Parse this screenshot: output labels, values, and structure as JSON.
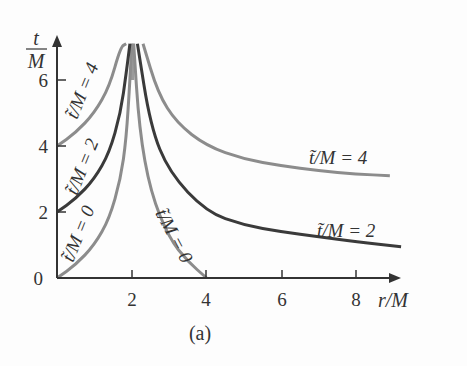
{
  "chart_data": {
    "type": "line",
    "title": "",
    "caption": "(a)",
    "xlabel": "r/M",
    "ylabel_num": "t",
    "ylabel_den": "M",
    "xlim": [
      0,
      9.5
    ],
    "ylim": [
      0,
      7.1
    ],
    "xticks": [
      "2",
      "4",
      "6",
      "8"
    ],
    "yticks": [
      "0",
      "2",
      "4",
      "6"
    ],
    "grid": false,
    "series": [
      {
        "name": "t̃/M = 0 (r<2M)",
        "color": "#8c8c8c",
        "x": [
          0,
          0.5,
          1.0,
          1.4,
          1.7,
          1.85,
          1.95,
          2.0
        ],
        "y": [
          0,
          0.4,
          1.0,
          1.8,
          3.0,
          4.2,
          6.0,
          7.1
        ]
      },
      {
        "name": "t̃/M = 2 (r<2M)",
        "color": "#3a3a3a",
        "x": [
          0,
          0.5,
          1.0,
          1.4,
          1.7,
          1.85,
          1.95
        ],
        "y": [
          2,
          2.4,
          3.0,
          3.8,
          5.0,
          6.2,
          7.1
        ]
      },
      {
        "name": "t̃/M = 4 (r<2M)",
        "color": "#8c8c8c",
        "x": [
          0,
          0.5,
          1.0,
          1.4,
          1.7,
          1.85
        ],
        "y": [
          4,
          4.4,
          5.0,
          5.8,
          7.0,
          7.1
        ]
      },
      {
        "name": "t̃/M = 0 (r>2M)",
        "color": "#8c8c8c",
        "x": [
          2.05,
          2.2,
          2.5,
          3.0,
          3.5,
          4.0
        ],
        "y": [
          7.1,
          4.5,
          2.6,
          1.2,
          0.5,
          0
        ]
      },
      {
        "name": "t̃/M = 2 (r>2M)",
        "color": "#3a3a3a",
        "x": [
          2.15,
          2.5,
          3.0,
          4.0,
          5.0,
          6.0,
          7.0,
          8.0,
          9.2
        ],
        "y": [
          7.1,
          4.6,
          3.2,
          2.0,
          1.6,
          1.4,
          1.25,
          1.1,
          0.95
        ]
      },
      {
        "name": "t̃/M = 4 (r>2M)",
        "color": "#8c8c8c",
        "x": [
          2.3,
          2.7,
          3.2,
          4.0,
          5.0,
          6.0,
          7.0,
          8.0,
          8.9
        ],
        "y": [
          7.1,
          5.6,
          4.7,
          4.0,
          3.6,
          3.4,
          3.25,
          3.15,
          3.1
        ]
      }
    ],
    "annotations": [
      {
        "text": "t̃/M = 4",
        "near": "left branch, rotated"
      },
      {
        "text": "t̃/M = 2",
        "near": "left branch, rotated"
      },
      {
        "text": "t̃/M = 0",
        "near": "left branch, rotated"
      },
      {
        "text": "t̃/M = 0",
        "near": "right branch, rotated"
      },
      {
        "text": "t̃/M = 4",
        "near": "right branch end"
      },
      {
        "text": "t̃/M = 2",
        "near": "right branch end"
      }
    ]
  },
  "labels": {
    "x_axis": "r/M",
    "y_num": "t",
    "y_den": "M",
    "caption": "(a)",
    "xt": [
      "2",
      "4",
      "6",
      "8"
    ],
    "yt": [
      "0",
      "2",
      "4",
      "6"
    ],
    "l4": "t̃/M = 4",
    "l2": "t̃/M = 2",
    "l0": "t̃/M = 0",
    "r0": "t̃/M = 0",
    "r4": "t̃/M = 4",
    "r2": "t̃/M = 2"
  }
}
